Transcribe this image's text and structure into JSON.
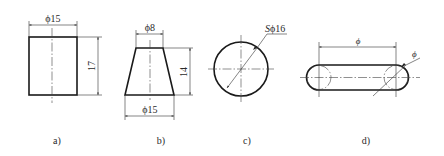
{
  "figure": {
    "views": [
      {
        "id": "a",
        "label": "a)",
        "shape": "cylinder",
        "dimensions": {
          "diameter": "ϕ15",
          "height": "17"
        }
      },
      {
        "id": "b",
        "label": "b)",
        "shape": "truncated-cone",
        "dimensions": {
          "top_diameter": "ϕ8",
          "bottom_diameter": "ϕ15",
          "height": "14"
        }
      },
      {
        "id": "c",
        "label": "c)",
        "shape": "sphere",
        "dimensions": {
          "sphere_diameter_prefix": "S",
          "sphere_diameter": "ϕ16"
        }
      },
      {
        "id": "d",
        "label": "d)",
        "shape": "torus-slot",
        "dimensions": {
          "center_distance": "ϕ",
          "section_diameter": "ϕ"
        }
      }
    ],
    "colors": {
      "line": "#1a1a1a",
      "background": "#ffffff"
    }
  }
}
